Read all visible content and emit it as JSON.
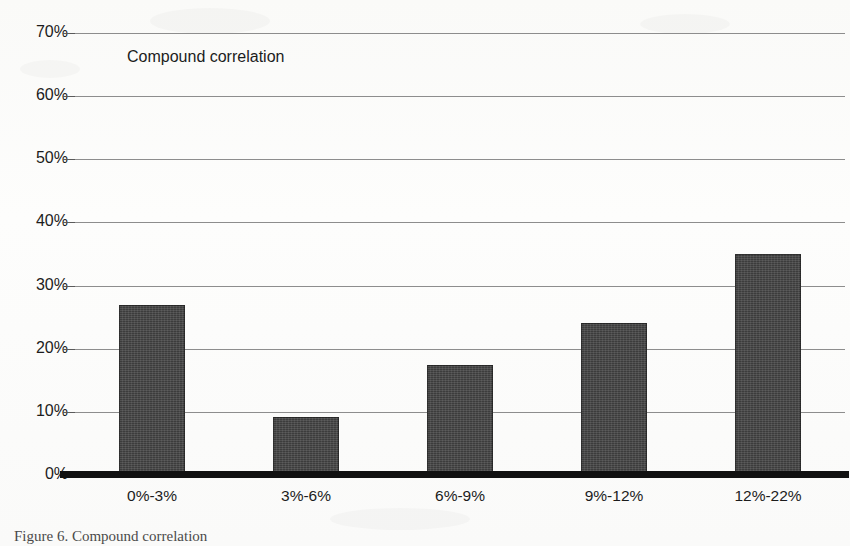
{
  "figure": {
    "caption": "Figure 6. Compound correlation"
  },
  "chart_data": {
    "type": "bar",
    "title": "Compound correlation",
    "xlabel": "",
    "ylabel": "",
    "categories": [
      "0%-3%",
      "3%-6%",
      "6%-9%",
      "9%-12%",
      "12%-22%"
    ],
    "values": [
      27,
      9.2,
      17.5,
      24,
      35
    ],
    "value_labels": [
      "27%",
      "9.2%",
      "17.5%",
      "24%",
      "35%"
    ],
    "ylim": [
      0,
      70
    ],
    "yticks": [
      0,
      10,
      20,
      30,
      40,
      50,
      60,
      70
    ],
    "ytick_labels": [
      "0%",
      "10%",
      "20%",
      "30%",
      "40%",
      "50%",
      "60%",
      "70%"
    ],
    "grid": true,
    "legend": "none",
    "series": [
      {
        "name": "Compound correlation",
        "values": [
          27,
          9.2,
          17.5,
          24,
          35
        ]
      }
    ],
    "colors": {
      "bar_fill": "#3c3c3c",
      "gridline": "#8d8d8d",
      "axis": "#111111",
      "text": "#1c1c1c",
      "background": "#ffffff"
    }
  }
}
